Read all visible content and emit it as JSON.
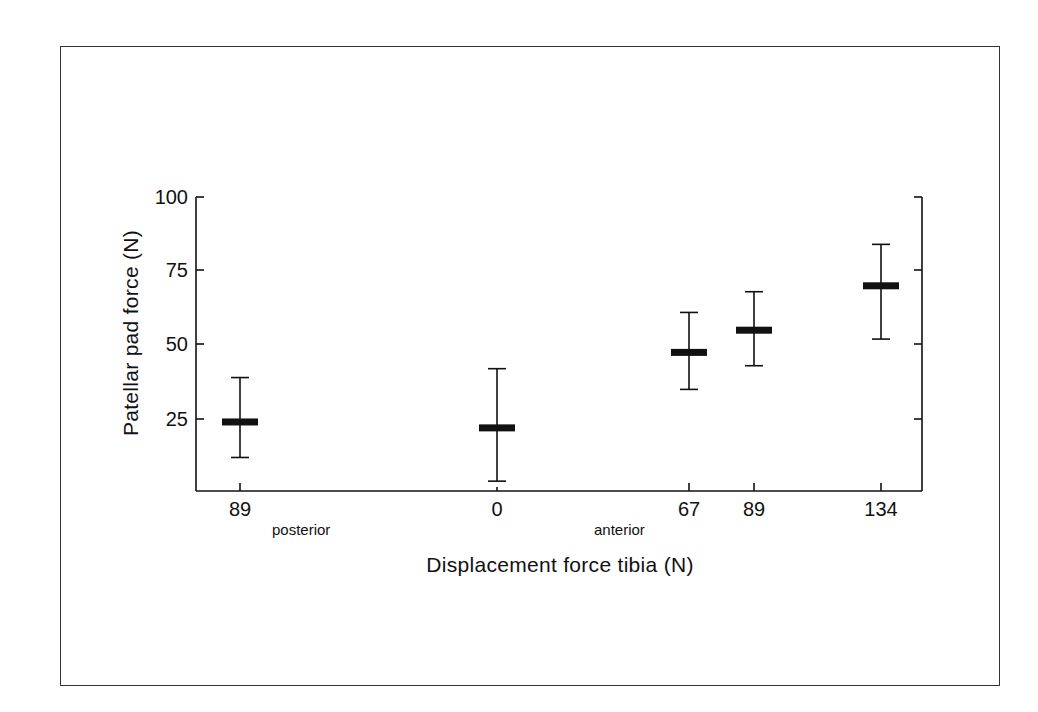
{
  "chart_data": {
    "type": "scatter",
    "subtype": "mean-with-error-bars",
    "title": "",
    "xlabel": "Displacement force tibia (N)",
    "ylabel": "Patellar pad force (N)",
    "ylim": [
      0,
      100
    ],
    "yticks": [
      25,
      50,
      75,
      100
    ],
    "categories": [
      "89",
      "0",
      "67",
      "89",
      "134"
    ],
    "category_direction": [
      "posterior",
      "neutral",
      "anterior",
      "anterior",
      "anterior"
    ],
    "direction_labels": [
      "posterior",
      "anterior"
    ],
    "points": [
      {
        "label": "89",
        "direction": "posterior",
        "mean": 24,
        "upper": 39,
        "lower": 12
      },
      {
        "label": "0",
        "direction": "neutral",
        "mean": 22,
        "upper": 42,
        "lower": 4
      },
      {
        "label": "67",
        "direction": "anterior",
        "mean": 47.5,
        "upper": 61,
        "lower": 35
      },
      {
        "label": "89",
        "direction": "anterior",
        "mean": 55,
        "upper": 68,
        "lower": 43
      },
      {
        "label": "134",
        "direction": "anterior",
        "mean": 70,
        "upper": 84,
        "lower": 52
      }
    ],
    "grid": false,
    "legend": null
  },
  "labels": {
    "ytick_100": "100",
    "ytick_75": "75",
    "ytick_50": "50",
    "ytick_25": "25",
    "xtick_0": "89",
    "xtick_1": "0",
    "xtick_2": "67",
    "xtick_3": "89",
    "xtick_4": "134",
    "posterior": "posterior",
    "anterior": "anterior",
    "xlabel": "Displacement force tibia (N)",
    "ylabel": "Patellar pad force (N)"
  },
  "colors": {
    "ink": "#111111",
    "frame": "#333333",
    "background": "#ffffff"
  }
}
